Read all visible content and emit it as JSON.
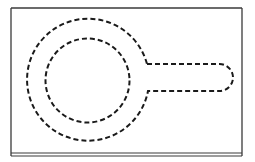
{
  "figure": {
    "type": "patent-style line drawing",
    "colors": {
      "background": "#ffffff",
      "frame": "#3a3a3a",
      "dashed_outline": "#1a1a1a"
    },
    "frame": {
      "x": 11,
      "y": 8,
      "width": 231,
      "height": 145,
      "bottom_double_line_y": [
        153,
        156
      ]
    },
    "outer_contour": {
      "center": [
        88,
        80.5
      ],
      "radius": 61,
      "handle": {
        "top_y": 64,
        "bottom_y": 91,
        "start_x": 147,
        "end_x": 233,
        "cap_radius": 13.5
      }
    },
    "inner_circle": {
      "center": [
        87.5,
        80.5
      ],
      "radius": 42
    },
    "dash_pattern": "5 3",
    "stroke_width": 2
  }
}
